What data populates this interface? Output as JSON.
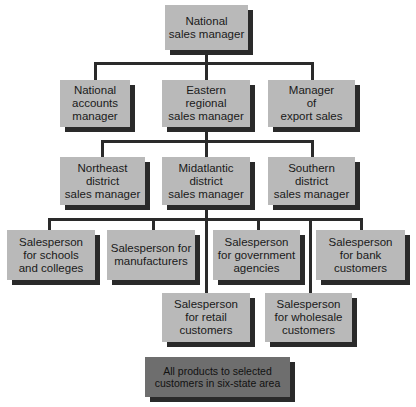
{
  "chart": {
    "root": {
      "label": "National\nsales manager"
    },
    "level2": [
      {
        "label": "National\naccounts\nmanager"
      },
      {
        "label": "Eastern\nregional\nsales manager"
      },
      {
        "label": "Manager\nof\nexport sales"
      }
    ],
    "level3": [
      {
        "label": "Northeast\ndistrict\nsales manager"
      },
      {
        "label": "Midatlantic\ndistrict\nsales manager"
      },
      {
        "label": "Southern\ndistrict\nsales manager"
      }
    ],
    "level4": [
      {
        "label": "Salesperson\nfor schools\nand colleges"
      },
      {
        "label": "Salesperson for\nmanufacturers"
      },
      {
        "label": "Salesperson\nfor government\nagencies"
      },
      {
        "label": "Salesperson\nfor bank\ncustomers"
      },
      {
        "label": "Salesperson\nfor retail\ncustomers"
      },
      {
        "label": "Salesperson\nfor wholesale\ncustomers"
      }
    ],
    "footer": {
      "label": "All products to selected\ncustomers in six-state area"
    }
  },
  "colors": {
    "box": "#b9b9b9",
    "footer_box": "#6e6e6e",
    "line": "#2a2a2a"
  }
}
